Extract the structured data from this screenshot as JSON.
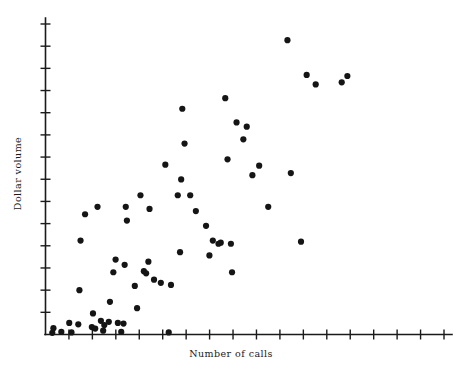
{
  "chart_data": {
    "type": "scatter",
    "title": "",
    "xlabel": "Number of calls",
    "ylabel": "Dollar volume",
    "grid": false,
    "legend": null,
    "xlim": [
      0,
      18
    ],
    "ylim": [
      0,
      15
    ],
    "x_ticks_count": 17,
    "y_ticks_count": 14,
    "x_tick_labels": [],
    "y_tick_labels": [],
    "marker": {
      "shape": "circle",
      "color": "#151515",
      "radius_px": 3.1
    },
    "n_points": 73,
    "points": [
      [
        0.35,
        0.3
      ],
      [
        0.3,
        0.08
      ],
      [
        0.7,
        0.12
      ],
      [
        1.05,
        0.55
      ],
      [
        1.15,
        0.1
      ],
      [
        1.45,
        0.48
      ],
      [
        1.5,
        2.1
      ],
      [
        1.55,
        4.45
      ],
      [
        1.75,
        5.7
      ],
      [
        2.05,
        0.35
      ],
      [
        2.1,
        1.0
      ],
      [
        2.2,
        0.28
      ],
      [
        2.3,
        6.05
      ],
      [
        2.45,
        0.65
      ],
      [
        2.55,
        0.18
      ],
      [
        2.6,
        0.45
      ],
      [
        2.8,
        0.6
      ],
      [
        2.85,
        1.55
      ],
      [
        3.0,
        2.95
      ],
      [
        3.1,
        3.55
      ],
      [
        3.2,
        0.55
      ],
      [
        3.35,
        0.12
      ],
      [
        3.45,
        0.52
      ],
      [
        3.5,
        3.3
      ],
      [
        3.55,
        6.05
      ],
      [
        3.6,
        5.4
      ],
      [
        3.95,
        2.3
      ],
      [
        4.05,
        1.25
      ],
      [
        4.2,
        6.6
      ],
      [
        4.35,
        3.0
      ],
      [
        4.45,
        2.9
      ],
      [
        4.55,
        3.45
      ],
      [
        4.6,
        5.95
      ],
      [
        4.8,
        2.6
      ],
      [
        5.1,
        2.45
      ],
      [
        5.3,
        8.05
      ],
      [
        5.45,
        0.1
      ],
      [
        5.55,
        2.35
      ],
      [
        5.85,
        6.6
      ],
      [
        5.95,
        3.9
      ],
      [
        6.0,
        7.35
      ],
      [
        6.05,
        10.7
      ],
      [
        6.15,
        9.05
      ],
      [
        6.4,
        6.6
      ],
      [
        6.65,
        5.85
      ],
      [
        7.1,
        5.15
      ],
      [
        7.25,
        3.75
      ],
      [
        7.4,
        4.45
      ],
      [
        7.65,
        4.3
      ],
      [
        7.75,
        4.35
      ],
      [
        7.95,
        11.2
      ],
      [
        8.05,
        8.3
      ],
      [
        8.2,
        4.3
      ],
      [
        8.25,
        2.95
      ],
      [
        8.45,
        10.05
      ],
      [
        8.75,
        9.25
      ],
      [
        8.9,
        9.85
      ],
      [
        9.15,
        7.55
      ],
      [
        9.45,
        8.0
      ],
      [
        9.85,
        6.05
      ],
      [
        10.7,
        13.95
      ],
      [
        10.85,
        7.65
      ],
      [
        11.3,
        4.4
      ],
      [
        11.55,
        12.3
      ],
      [
        11.95,
        11.85
      ],
      [
        13.1,
        11.95
      ],
      [
        13.35,
        12.25
      ]
    ]
  },
  "axes": {
    "x_axis_label": "Number of calls",
    "y_axis_label": "Dollar volume"
  },
  "colors": {
    "axis": "#1a1a1a",
    "marker": "#151515",
    "background": "#ffffff"
  }
}
